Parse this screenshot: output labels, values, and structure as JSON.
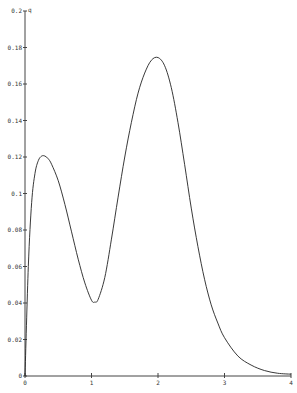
{
  "chart_data": {
    "type": "line",
    "title": "",
    "xlabel": "",
    "ylabel": "q",
    "xlim": [
      0,
      4
    ],
    "ylim": [
      0,
      0.2
    ],
    "grid": false,
    "legend": null,
    "x_ticks": [
      "0",
      "1",
      "2",
      "3",
      "4"
    ],
    "y_ticks": [
      "0",
      "0.02",
      "0.04",
      "0.06",
      "0.08",
      "0.1",
      "0.12",
      "0.14",
      "0.16",
      "0.18",
      "0.2"
    ],
    "series": [
      {
        "name": "q",
        "x": [
          0,
          0.05,
          0.1,
          0.15,
          0.2,
          0.25,
          0.3,
          0.35,
          0.4,
          0.5,
          0.6,
          0.7,
          0.8,
          0.9,
          1.0,
          1.05,
          1.1,
          1.2,
          1.3,
          1.4,
          1.5,
          1.6,
          1.7,
          1.8,
          1.9,
          2.0,
          2.1,
          2.2,
          2.3,
          2.4,
          2.5,
          2.6,
          2.7,
          2.8,
          2.9,
          3.0,
          3.2,
          3.4,
          3.6,
          3.8,
          4.0
        ],
        "y": [
          0,
          0.06,
          0.095,
          0.111,
          0.118,
          0.1205,
          0.1205,
          0.119,
          0.116,
          0.107,
          0.094,
          0.079,
          0.064,
          0.051,
          0.0415,
          0.0405,
          0.042,
          0.054,
          0.075,
          0.098,
          0.12,
          0.139,
          0.155,
          0.166,
          0.173,
          0.1745,
          0.17,
          0.158,
          0.139,
          0.116,
          0.092,
          0.071,
          0.053,
          0.039,
          0.029,
          0.021,
          0.011,
          0.006,
          0.003,
          0.0015,
          0.001
        ]
      }
    ]
  }
}
